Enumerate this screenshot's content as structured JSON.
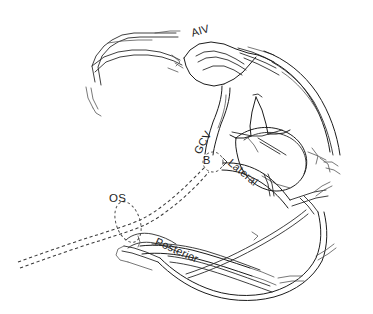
{
  "figure": {
    "type": "anatomical-line-drawing",
    "background_color": "#ffffff",
    "line_color": "#1c1c1c",
    "text_color": "#232323",
    "width": 373,
    "height": 314
  },
  "labels": {
    "aiv": "AIV",
    "gcv": "GCV",
    "balloon": "B",
    "lateral": "Lateral",
    "os": "OS",
    "posterior": "Posterior"
  },
  "annotations": {
    "balloon_marker": {
      "label": "B",
      "shape": "dashed-circle",
      "cx": 213,
      "cy": 162,
      "r": 10
    },
    "os_marker": {
      "label": "OS",
      "shape": "dashed-ellipse",
      "cx": 128,
      "cy": 222,
      "rx": 12,
      "ry": 20,
      "rotation_deg": -18
    }
  },
  "elements": {
    "catheter": {
      "name": "catheter-shaft",
      "style": "double-dashed-line",
      "from": "lower-left-edge",
      "through": "os",
      "to": "balloon-b"
    },
    "vessels": [
      {
        "name": "anterior-interventricular-vein",
        "abbrev": "AIV"
      },
      {
        "name": "great-cardiac-vein",
        "abbrev": "GCV"
      },
      {
        "name": "lateral-vein",
        "abbrev": "Lateral"
      },
      {
        "name": "posterior-vein",
        "abbrev": "Posterior"
      },
      {
        "name": "coronary-sinus-ostium",
        "abbrev": "OS"
      }
    ]
  }
}
